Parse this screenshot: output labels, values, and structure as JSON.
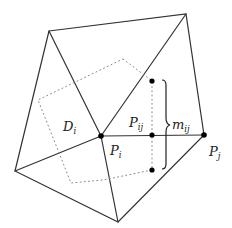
{
  "figure": {
    "type": "finite-volume dual mesh diagram",
    "labels": {
      "D_i": {
        "main": "D",
        "sub": "i"
      },
      "P_i": {
        "main": "P",
        "sub": "i"
      },
      "P_j": {
        "main": "P",
        "sub": "j"
      },
      "P_ij": {
        "main": "P",
        "sub": "ij"
      },
      "m_ij": {
        "main": "m",
        "sub": "ij"
      }
    },
    "vertices": {
      "top_left": [
        49,
        31
      ],
      "top_right": [
        186,
        14
      ],
      "bottom_left": [
        15,
        171
      ],
      "bottom": [
        118,
        222
      ],
      "P_i": [
        101,
        136
      ],
      "P_j": [
        204,
        135
      ]
    },
    "points": {
      "P_ij": [
        152,
        135
      ],
      "dual_top": [
        152,
        81
      ],
      "dual_bottom": [
        152,
        170
      ]
    },
    "colors": {
      "edge": "#333333",
      "dual_boundary": "#888888",
      "node": "#000000"
    }
  }
}
